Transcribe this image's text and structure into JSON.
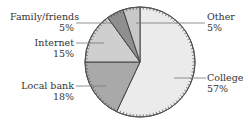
{
  "chart_data": {
    "type": "pie",
    "title": "",
    "center": [
      140,
      62
    ],
    "radius": 55,
    "start_angle_deg": 0,
    "slices": [
      {
        "label": "College",
        "value": 57,
        "display": "57%",
        "color": "#ebebeb",
        "direction": "clockwise"
      },
      {
        "label": "Local bank",
        "value": 18,
        "display": "18%",
        "color": "#a9a9a9"
      },
      {
        "label": "Internet",
        "value": 15,
        "display": "15%",
        "color": "#cfcfcf"
      },
      {
        "label": "Family/friends",
        "value": 5,
        "display": "5%",
        "color": "#8f8f8f"
      },
      {
        "label": "Other",
        "value": 5,
        "display": "5%",
        "color": "#c8c8c8"
      }
    ],
    "legend": "none (callout labels)",
    "tick_marks_on_rim": true
  },
  "labels": {
    "college": {
      "name": "College",
      "pct": "57%"
    },
    "local_bank": {
      "name": "Local bank",
      "pct": "18%"
    },
    "internet": {
      "name": "Internet",
      "pct": "15%"
    },
    "family": {
      "name": "Family/friends",
      "pct": "5%"
    },
    "other": {
      "name": "Other",
      "pct": "5%"
    }
  }
}
